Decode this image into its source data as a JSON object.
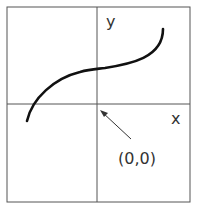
{
  "diagram": {
    "axis_labels": {
      "x": "x",
      "y": "y"
    },
    "origin_label": "(0,0)",
    "colors": {
      "frame": "#555555",
      "axes": "#555555",
      "curve": "#111111",
      "text": "#333333"
    },
    "curve_description": "Increasing S-shaped (cubic-like) curve crossing the positive y-axis, with inflection on the y-axis"
  }
}
